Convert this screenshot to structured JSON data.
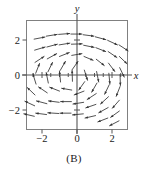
{
  "figure": {
    "caption": "(B)",
    "panel_label": "(B)"
  },
  "chart_data": {
    "type": "scatter",
    "subtype": "direction-field",
    "title": "",
    "xlabel": "x",
    "ylabel": "y",
    "xlim": [
      -3,
      3
    ],
    "ylim": [
      -3,
      3
    ],
    "grid": false,
    "legend": null,
    "xticks": [
      -2,
      0,
      2
    ],
    "xticklabels": [
      "−2",
      "0",
      "2"
    ],
    "yticks": [
      -2,
      0,
      2
    ],
    "yticklabels": [
      "−2",
      "0",
      "2"
    ],
    "minor_xticks": [
      -2.5,
      -1.5,
      -1,
      -0.5,
      0.5,
      1,
      1.5,
      2.5
    ],
    "axis_color": "#555555",
    "frame_color": "#777777",
    "arrow_color": "#333333",
    "arrows": [
      {
        "x": -2.45,
        "y": 2.05,
        "dx": 0.62,
        "dy": 0.12
      },
      {
        "x": -1.75,
        "y": 2.22,
        "dx": 0.62,
        "dy": 0.1
      },
      {
        "x": -1.05,
        "y": 2.32,
        "dx": 0.63,
        "dy": 0.05
      },
      {
        "x": -0.35,
        "y": 2.34,
        "dx": 0.63,
        "dy": 0.0
      },
      {
        "x": 0.35,
        "y": 2.3,
        "dx": 0.62,
        "dy": -0.08
      },
      {
        "x": 1.05,
        "y": 2.18,
        "dx": 0.6,
        "dy": -0.16
      },
      {
        "x": 1.75,
        "y": 1.98,
        "dx": 0.56,
        "dy": -0.26
      },
      {
        "x": 2.4,
        "y": 1.72,
        "dx": 0.52,
        "dy": -0.34
      },
      {
        "x": -2.42,
        "y": 1.42,
        "dx": 0.6,
        "dy": 0.18
      },
      {
        "x": -1.72,
        "y": 1.6,
        "dx": 0.6,
        "dy": 0.16
      },
      {
        "x": -1.02,
        "y": 1.72,
        "dx": 0.61,
        "dy": 0.1
      },
      {
        "x": -0.32,
        "y": 1.76,
        "dx": 0.62,
        "dy": 0.02
      },
      {
        "x": 0.38,
        "y": 1.7,
        "dx": 0.6,
        "dy": -0.12
      },
      {
        "x": 1.08,
        "y": 1.56,
        "dx": 0.56,
        "dy": -0.22
      },
      {
        "x": 1.78,
        "y": 1.34,
        "dx": 0.5,
        "dy": -0.34
      },
      {
        "x": 2.42,
        "y": 1.06,
        "dx": 0.44,
        "dy": -0.42
      },
      {
        "x": -2.4,
        "y": 0.72,
        "dx": 0.52,
        "dy": 0.34
      },
      {
        "x": -1.7,
        "y": 0.92,
        "dx": 0.54,
        "dy": 0.3
      },
      {
        "x": -1.0,
        "y": 1.06,
        "dx": 0.56,
        "dy": 0.22
      },
      {
        "x": -0.3,
        "y": 1.12,
        "dx": 0.58,
        "dy": 0.1
      },
      {
        "x": 0.4,
        "y": 1.06,
        "dx": 0.52,
        "dy": -0.22
      },
      {
        "x": 1.1,
        "y": 0.9,
        "dx": 0.46,
        "dy": -0.36
      },
      {
        "x": 1.8,
        "y": 0.68,
        "dx": 0.36,
        "dy": -0.48
      },
      {
        "x": 2.44,
        "y": 0.42,
        "dx": 0.26,
        "dy": -0.54
      },
      {
        "x": -2.36,
        "y": 0.1,
        "dx": 0.22,
        "dy": 0.56
      },
      {
        "x": -1.66,
        "y": 0.18,
        "dx": 0.26,
        "dy": 0.54
      },
      {
        "x": -0.96,
        "y": 0.26,
        "dx": 0.3,
        "dy": 0.52
      },
      {
        "x": -0.28,
        "y": 0.3,
        "dx": 0.34,
        "dy": 0.48
      },
      {
        "x": 0.42,
        "y": 0.28,
        "dx": 0.18,
        "dy": -0.58
      },
      {
        "x": 1.12,
        "y": 0.2,
        "dx": 0.12,
        "dy": -0.6
      },
      {
        "x": 1.82,
        "y": 0.1,
        "dx": 0.06,
        "dy": -0.62
      },
      {
        "x": 2.46,
        "y": 0.02,
        "dx": 0.02,
        "dy": -0.62
      },
      {
        "x": -2.34,
        "y": -0.52,
        "dx": -0.18,
        "dy": 0.58
      },
      {
        "x": -1.64,
        "y": -0.46,
        "dx": -0.12,
        "dy": 0.6
      },
      {
        "x": -0.94,
        "y": -0.4,
        "dx": -0.06,
        "dy": 0.62
      },
      {
        "x": -0.26,
        "y": -0.36,
        "dx": -0.02,
        "dy": 0.62
      },
      {
        "x": 0.44,
        "y": -0.38,
        "dx": -0.34,
        "dy": -0.48
      },
      {
        "x": 1.14,
        "y": -0.46,
        "dx": -0.3,
        "dy": -0.52
      },
      {
        "x": 1.84,
        "y": -0.56,
        "dx": -0.26,
        "dy": -0.54
      },
      {
        "x": 2.46,
        "y": -0.66,
        "dx": -0.22,
        "dy": -0.56
      },
      {
        "x": -2.4,
        "y": -1.14,
        "dx": -0.44,
        "dy": 0.42
      },
      {
        "x": -1.7,
        "y": -1.02,
        "dx": -0.5,
        "dy": 0.34
      },
      {
        "x": -1.0,
        "y": -0.92,
        "dx": -0.56,
        "dy": 0.22
      },
      {
        "x": -0.3,
        "y": -0.86,
        "dx": -0.58,
        "dy": 0.1
      },
      {
        "x": 0.4,
        "y": -0.92,
        "dx": -0.56,
        "dy": -0.22
      },
      {
        "x": 1.1,
        "y": -1.06,
        "dx": -0.52,
        "dy": -0.34
      },
      {
        "x": 1.8,
        "y": -1.24,
        "dx": -0.46,
        "dy": -0.42
      },
      {
        "x": 2.42,
        "y": -1.44,
        "dx": -0.4,
        "dy": -0.46
      },
      {
        "x": -2.42,
        "y": -1.76,
        "dx": -0.56,
        "dy": 0.26
      },
      {
        "x": -1.72,
        "y": -1.64,
        "dx": -0.6,
        "dy": 0.16
      },
      {
        "x": -1.02,
        "y": -1.56,
        "dx": -0.61,
        "dy": 0.08
      },
      {
        "x": -0.32,
        "y": -1.52,
        "dx": -0.62,
        "dy": 0.0
      },
      {
        "x": 0.38,
        "y": -1.56,
        "dx": -0.61,
        "dy": -0.1
      },
      {
        "x": 1.08,
        "y": -1.68,
        "dx": -0.58,
        "dy": -0.2
      },
      {
        "x": 1.78,
        "y": -1.86,
        "dx": -0.54,
        "dy": -0.3
      },
      {
        "x": 2.42,
        "y": -2.06,
        "dx": -0.5,
        "dy": -0.36
      },
      {
        "x": -2.44,
        "y": -2.36,
        "dx": -0.6,
        "dy": 0.14
      },
      {
        "x": -1.74,
        "y": -2.26,
        "dx": -0.62,
        "dy": 0.08
      },
      {
        "x": -1.04,
        "y": -2.2,
        "dx": -0.63,
        "dy": 0.04
      },
      {
        "x": -0.34,
        "y": -2.18,
        "dx": -0.63,
        "dy": 0.0
      },
      {
        "x": 0.36,
        "y": -2.22,
        "dx": -0.62,
        "dy": -0.06
      },
      {
        "x": 1.06,
        "y": -2.32,
        "dx": -0.6,
        "dy": -0.14
      },
      {
        "x": 1.76,
        "y": -2.46,
        "dx": -0.57,
        "dy": -0.22
      },
      {
        "x": 2.4,
        "y": -2.62,
        "dx": -0.54,
        "dy": -0.28
      }
    ]
  }
}
